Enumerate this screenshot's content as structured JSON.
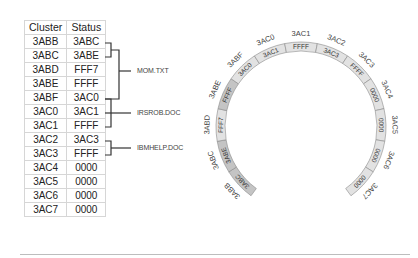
{
  "table": {
    "headers": [
      "Cluster",
      "Status"
    ],
    "rows": [
      {
        "cluster": "3ABB",
        "status": "3ABC"
      },
      {
        "cluster": "3ABC",
        "status": "3ABE"
      },
      {
        "cluster": "3ABD",
        "status": "FFF7"
      },
      {
        "cluster": "3ABE",
        "status": "FFFF"
      },
      {
        "cluster": "3ABF",
        "status": "3AC0"
      },
      {
        "cluster": "3AC0",
        "status": "3AC1"
      },
      {
        "cluster": "3AC1",
        "status": "FFFF"
      },
      {
        "cluster": "3AC2",
        "status": "3AC3"
      },
      {
        "cluster": "3AC3",
        "status": "FFFF"
      },
      {
        "cluster": "3AC4",
        "status": "0000"
      },
      {
        "cluster": "3AC5",
        "status": "0000"
      },
      {
        "cluster": "3AC6",
        "status": "0000"
      },
      {
        "cluster": "3AC7",
        "status": "0000"
      }
    ]
  },
  "files": [
    {
      "name": "MOM.TXT"
    },
    {
      "name": "IRSROB.DOC"
    },
    {
      "name": "IBMHELP.DOC"
    }
  ],
  "ring": {
    "segments": [
      {
        "cluster": "3ABB",
        "status": "3ABC",
        "dark": true
      },
      {
        "cluster": "3ABC",
        "status": "3ABE",
        "dark": true
      },
      {
        "cluster": "3ABD",
        "status": "FFF7",
        "dark": false
      },
      {
        "cluster": "3ABE",
        "status": "FFFF",
        "dark": true
      },
      {
        "cluster": "3ABF",
        "status": "3AC0",
        "dark": false
      },
      {
        "cluster": "3AC0",
        "status": "3AC1",
        "dark": false
      },
      {
        "cluster": "3AC1",
        "status": "FFFF",
        "dark": false
      },
      {
        "cluster": "3AC2",
        "status": "3AC3",
        "dark": false
      },
      {
        "cluster": "3AC3",
        "status": "FFFF",
        "dark": false
      },
      {
        "cluster": "3AC4",
        "status": "0000",
        "dark": false
      },
      {
        "cluster": "3AC5",
        "status": "0000",
        "dark": false
      },
      {
        "cluster": "3AC6",
        "status": "0000",
        "dark": false
      },
      {
        "cluster": "3AC7",
        "status": "0000",
        "dark": false
      }
    ]
  },
  "colors": {
    "ring_light": "#e2e2e2",
    "ring_dark": "#c4c4c4",
    "ring_stroke": "#8a8a8a",
    "bracket": "#333333",
    "divider": "#bdbdbd"
  }
}
